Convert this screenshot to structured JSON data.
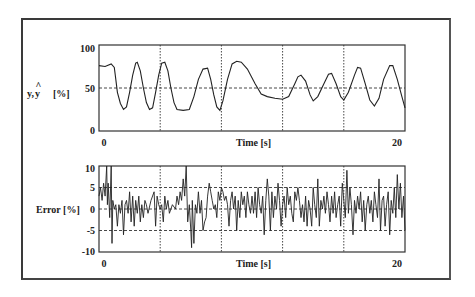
{
  "chart_data": [
    {
      "type": "line",
      "title": "",
      "xlabel": "Time [s]",
      "ylabel": "y, ŷ  [%]",
      "xlim": [
        0,
        20
      ],
      "ylim": [
        0,
        100
      ],
      "x_tick_labels": [
        "0",
        "20"
      ],
      "y_tick_labels": [
        "0",
        "50",
        "100"
      ],
      "grid": {
        "vertical_x": [
          4,
          8,
          12,
          16
        ],
        "horizontal_y": [
          50
        ],
        "style": "dotted"
      },
      "series": [
        {
          "name": "y / ŷ (measured and predicted)",
          "points": [
            [
              0.0,
              76
            ],
            [
              0.4,
              75
            ],
            [
              0.8,
              78
            ],
            [
              1.0,
              74
            ],
            [
              1.1,
              60
            ],
            [
              1.2,
              45
            ],
            [
              1.4,
              32
            ],
            [
              1.6,
              25
            ],
            [
              1.8,
              28
            ],
            [
              2.0,
              45
            ],
            [
              2.2,
              65
            ],
            [
              2.4,
              79
            ],
            [
              2.5,
              80
            ],
            [
              2.7,
              70
            ],
            [
              2.9,
              50
            ],
            [
              3.1,
              33
            ],
            [
              3.3,
              25
            ],
            [
              3.5,
              27
            ],
            [
              3.7,
              45
            ],
            [
              3.9,
              65
            ],
            [
              4.1,
              79
            ],
            [
              4.3,
              80
            ],
            [
              4.5,
              70
            ],
            [
              4.7,
              50
            ],
            [
              4.9,
              33
            ],
            [
              5.1,
              25
            ],
            [
              5.5,
              24
            ],
            [
              5.9,
              25
            ],
            [
              6.2,
              40
            ],
            [
              6.5,
              60
            ],
            [
              6.8,
              72
            ],
            [
              7.1,
              73
            ],
            [
              7.3,
              60
            ],
            [
              7.5,
              42
            ],
            [
              7.7,
              28
            ],
            [
              7.9,
              24
            ],
            [
              8.1,
              35
            ],
            [
              8.4,
              60
            ],
            [
              8.7,
              78
            ],
            [
              9.0,
              81
            ],
            [
              9.3,
              80
            ],
            [
              9.7,
              72
            ],
            [
              10.2,
              55
            ],
            [
              10.6,
              43
            ],
            [
              11.0,
              40
            ],
            [
              11.5,
              38
            ],
            [
              12.0,
              37
            ],
            [
              12.4,
              40
            ],
            [
              12.8,
              55
            ],
            [
              13.0,
              63
            ],
            [
              13.2,
              65
            ],
            [
              13.5,
              58
            ],
            [
              13.8,
              42
            ],
            [
              14.0,
              35
            ],
            [
              14.3,
              40
            ],
            [
              14.7,
              55
            ],
            [
              15.0,
              66
            ],
            [
              15.2,
              67
            ],
            [
              15.5,
              55
            ],
            [
              15.8,
              40
            ],
            [
              16.0,
              36
            ],
            [
              16.3,
              45
            ],
            [
              16.7,
              65
            ],
            [
              16.9,
              74
            ],
            [
              17.1,
              73
            ],
            [
              17.4,
              55
            ],
            [
              17.7,
              36
            ],
            [
              18.0,
              29
            ],
            [
              18.3,
              38
            ],
            [
              18.6,
              60
            ],
            [
              19.0,
              76
            ],
            [
              19.2,
              76
            ],
            [
              19.5,
              60
            ],
            [
              19.8,
              40
            ],
            [
              20.0,
              27
            ]
          ]
        }
      ]
    },
    {
      "type": "line",
      "title": "",
      "xlabel": "Time [s]",
      "ylabel": "Error [%]",
      "xlim": [
        0,
        20
      ],
      "ylim": [
        -10,
        10
      ],
      "x_tick_labels": [
        "0",
        "20"
      ],
      "y_tick_labels": [
        "10",
        "5",
        "0",
        "-5",
        "-10"
      ],
      "grid": {
        "vertical_x": [
          4,
          8,
          12,
          16
        ],
        "horizontal_y": [
          5,
          0,
          -5
        ],
        "style": "dotted"
      },
      "series": [
        {
          "name": "Error",
          "points": [
            [
              0.0,
              3
            ],
            [
              0.1,
              5
            ],
            [
              0.2,
              2
            ],
            [
              0.3,
              6
            ],
            [
              0.4,
              3
            ],
            [
              0.5,
              10
            ],
            [
              0.55,
              1
            ],
            [
              0.6,
              6
            ],
            [
              0.7,
              -2
            ],
            [
              0.8,
              10
            ],
            [
              0.85,
              -8
            ],
            [
              0.9,
              2
            ],
            [
              1.0,
              0
            ],
            [
              1.1,
              1
            ],
            [
              1.2,
              -4
            ],
            [
              1.3,
              1
            ],
            [
              1.4,
              -1
            ],
            [
              1.5,
              2
            ],
            [
              1.6,
              -6
            ],
            [
              1.7,
              1
            ],
            [
              1.8,
              2
            ],
            [
              1.9,
              -1
            ],
            [
              2.0,
              4
            ],
            [
              2.1,
              -3
            ],
            [
              2.2,
              3
            ],
            [
              2.3,
              -4
            ],
            [
              2.4,
              2
            ],
            [
              2.5,
              -1
            ],
            [
              2.6,
              3
            ],
            [
              2.7,
              -3
            ],
            [
              2.8,
              1
            ],
            [
              2.9,
              -2
            ],
            [
              3.0,
              2
            ],
            [
              3.1,
              1
            ],
            [
              3.2,
              -1
            ],
            [
              3.4,
              2
            ],
            [
              3.6,
              4
            ],
            [
              3.7,
              -4
            ],
            [
              3.8,
              3
            ],
            [
              3.9,
              1
            ],
            [
              4.0,
              0
            ],
            [
              4.1,
              1
            ],
            [
              4.2,
              -3
            ],
            [
              4.3,
              3
            ],
            [
              4.4,
              0
            ],
            [
              4.5,
              2
            ],
            [
              4.6,
              -1
            ],
            [
              4.8,
              1
            ],
            [
              5.0,
              0
            ],
            [
              5.1,
              3
            ],
            [
              5.2,
              1
            ],
            [
              5.3,
              4
            ],
            [
              5.4,
              2
            ],
            [
              5.5,
              7
            ],
            [
              5.6,
              3
            ],
            [
              5.7,
              10
            ],
            [
              5.8,
              -3
            ],
            [
              5.9,
              1
            ],
            [
              6.0,
              -5
            ],
            [
              6.05,
              -9
            ],
            [
              6.1,
              2
            ],
            [
              6.2,
              -8
            ],
            [
              6.3,
              1
            ],
            [
              6.4,
              -1
            ],
            [
              6.5,
              4
            ],
            [
              6.6,
              -1
            ],
            [
              6.7,
              2
            ],
            [
              6.8,
              -5
            ],
            [
              6.9,
              -3
            ],
            [
              7.0,
              -2
            ],
            [
              7.1,
              3
            ],
            [
              7.2,
              6
            ],
            [
              7.3,
              4
            ],
            [
              7.4,
              2
            ],
            [
              7.5,
              0
            ],
            [
              7.6,
              1
            ],
            [
              7.7,
              -2
            ],
            [
              7.8,
              4
            ],
            [
              7.9,
              2
            ],
            [
              8.0,
              5
            ],
            [
              8.1,
              4
            ],
            [
              8.2,
              2
            ],
            [
              8.3,
              3
            ],
            [
              8.4,
              1
            ],
            [
              8.5,
              -4
            ],
            [
              8.6,
              2
            ],
            [
              8.7,
              4
            ],
            [
              8.8,
              0
            ],
            [
              8.9,
              3
            ],
            [
              9.0,
              -5
            ],
            [
              9.1,
              2
            ],
            [
              9.2,
              -2
            ],
            [
              9.3,
              4
            ],
            [
              9.4,
              1
            ],
            [
              9.5,
              3
            ],
            [
              9.6,
              -2
            ],
            [
              9.7,
              4
            ],
            [
              9.8,
              1
            ],
            [
              9.9,
              -1
            ],
            [
              10.0,
              3
            ],
            [
              10.1,
              -1
            ],
            [
              10.2,
              4
            ],
            [
              10.3,
              -2
            ],
            [
              10.4,
              5
            ],
            [
              10.5,
              1
            ],
            [
              10.6,
              -1
            ],
            [
              10.7,
              3
            ],
            [
              10.8,
              -6
            ],
            [
              10.9,
              2
            ],
            [
              11.0,
              7
            ],
            [
              11.1,
              3
            ],
            [
              11.2,
              -5
            ],
            [
              11.3,
              4
            ],
            [
              11.4,
              -2
            ],
            [
              11.5,
              3
            ],
            [
              11.6,
              0
            ],
            [
              11.7,
              6
            ],
            [
              11.8,
              2
            ],
            [
              11.9,
              -4
            ],
            [
              12.0,
              1
            ],
            [
              12.1,
              3
            ],
            [
              12.2,
              -2
            ],
            [
              12.3,
              5
            ],
            [
              12.4,
              1
            ],
            [
              12.5,
              3
            ],
            [
              12.6,
              -1
            ],
            [
              12.7,
              -3
            ],
            [
              12.8,
              4
            ],
            [
              12.9,
              2
            ],
            [
              13.0,
              5
            ],
            [
              13.1,
              2
            ],
            [
              13.2,
              -2
            ],
            [
              13.3,
              1
            ],
            [
              13.4,
              -3
            ],
            [
              13.5,
              3
            ],
            [
              13.6,
              -4
            ],
            [
              13.7,
              2
            ],
            [
              13.8,
              0
            ],
            [
              13.9,
              -4
            ],
            [
              14.0,
              5
            ],
            [
              14.1,
              1
            ],
            [
              14.2,
              -2
            ],
            [
              14.3,
              7
            ],
            [
              14.4,
              -4
            ],
            [
              14.5,
              2
            ],
            [
              14.6,
              0
            ],
            [
              14.7,
              3
            ],
            [
              14.8,
              -1
            ],
            [
              14.9,
              4
            ],
            [
              15.0,
              1
            ],
            [
              15.1,
              -3
            ],
            [
              15.2,
              3
            ],
            [
              15.3,
              -1
            ],
            [
              15.4,
              4
            ],
            [
              15.5,
              -2
            ],
            [
              15.6,
              1
            ],
            [
              15.7,
              3
            ],
            [
              15.8,
              -4
            ],
            [
              15.9,
              6
            ],
            [
              16.0,
              2
            ],
            [
              16.1,
              -2
            ],
            [
              16.2,
              9
            ],
            [
              16.3,
              -1
            ],
            [
              16.4,
              5
            ],
            [
              16.5,
              1
            ],
            [
              16.6,
              -6
            ],
            [
              16.7,
              2
            ],
            [
              16.8,
              -1
            ],
            [
              16.9,
              3
            ],
            [
              17.0,
              0
            ],
            [
              17.1,
              4
            ],
            [
              17.2,
              -3
            ],
            [
              17.3,
              2
            ],
            [
              17.4,
              -5
            ],
            [
              17.5,
              1
            ],
            [
              17.6,
              3
            ],
            [
              17.7,
              -1
            ],
            [
              17.8,
              2
            ],
            [
              17.9,
              -3
            ],
            [
              18.0,
              4
            ],
            [
              18.1,
              1
            ],
            [
              18.2,
              -2
            ],
            [
              18.3,
              7
            ],
            [
              18.4,
              -5
            ],
            [
              18.5,
              2
            ],
            [
              18.6,
              3
            ],
            [
              18.7,
              -4
            ],
            [
              18.8,
              1
            ],
            [
              18.9,
              4
            ],
            [
              19.0,
              -6
            ],
            [
              19.1,
              2
            ],
            [
              19.2,
              -1
            ],
            [
              19.3,
              5
            ],
            [
              19.4,
              -2
            ],
            [
              19.5,
              8
            ],
            [
              19.6,
              0
            ],
            [
              19.7,
              6
            ],
            [
              19.8,
              -2
            ],
            [
              19.9,
              3
            ],
            [
              20.0,
              -5
            ]
          ]
        }
      ]
    }
  ],
  "labels": {
    "top_ylabel_y": "y,",
    "top_ylabel_yhat": "y",
    "top_ylabel_unit": "[%]",
    "top_xlabel": "Time [s]",
    "bottom_ylabel": "Error [%]",
    "bottom_xlabel": "Time [s]",
    "x_start": "0",
    "x_end": "20",
    "top_ticks": [
      "100",
      "50",
      "0"
    ],
    "bottom_ticks": [
      "10",
      "5",
      "0",
      "-5",
      "-10"
    ]
  }
}
